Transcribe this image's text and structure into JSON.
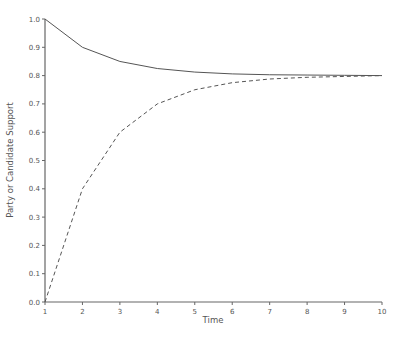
{
  "chart_data": {
    "type": "line",
    "title": "",
    "xlabel": "Time",
    "ylabel": "Party or Candidate Support",
    "x": [
      1,
      2,
      3,
      4,
      5,
      6,
      7,
      8,
      9,
      10
    ],
    "series": [
      {
        "name": "upper (solid)",
        "style": "solid",
        "values": [
          1.0,
          0.9,
          0.85,
          0.825,
          0.8125,
          0.806,
          0.803,
          0.802,
          0.801,
          0.8
        ]
      },
      {
        "name": "lower (dashed)",
        "style": "dashed",
        "values": [
          0.0,
          0.4,
          0.6,
          0.7,
          0.75,
          0.775,
          0.788,
          0.794,
          0.797,
          0.8
        ]
      }
    ],
    "xlim": [
      1,
      10
    ],
    "ylim": [
      0.0,
      1.0
    ],
    "xticks": [
      "1",
      "2",
      "3",
      "4",
      "5",
      "6",
      "7",
      "8",
      "9",
      "10"
    ],
    "yticks": [
      "0.0",
      "0.1",
      "0.2",
      "0.3",
      "0.4",
      "0.5",
      "0.6",
      "0.7",
      "0.8",
      "0.9",
      "1.0"
    ],
    "grid": false,
    "legend": null
  }
}
